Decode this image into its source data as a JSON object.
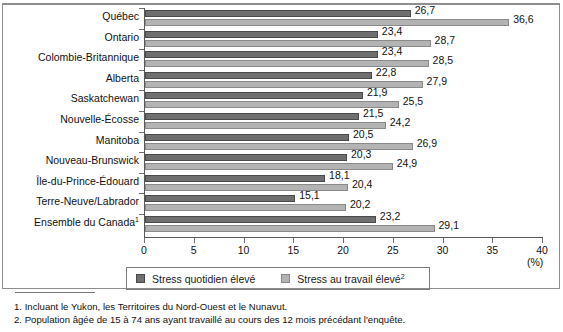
{
  "chart_data": {
    "type": "bar",
    "orientation": "horizontal",
    "title": "",
    "xlabel": "(%)",
    "ylabel": "",
    "xlim": [
      0,
      40
    ],
    "xticks": [
      0,
      5,
      10,
      15,
      20,
      25,
      30,
      35,
      40
    ],
    "grid": false,
    "legend_position": "bottom",
    "categories": [
      "Québec",
      "Ontario",
      "Colombie-Britannique",
      "Alberta",
      "Saskatchewan",
      "Nouvelle-Écosse",
      "Manitoba",
      "Nouveau-Brunswick",
      "Île-du-Prince-Édouard",
      "Terre-Neuve/Labrador",
      "Ensemble du Canada"
    ],
    "category_footnote_markers": [
      "",
      "",
      "",
      "",
      "",
      "",
      "",
      "",
      "",
      "",
      "1"
    ],
    "series": [
      {
        "name": "Stress quotidien élevé",
        "color": "#6f6f6f",
        "values": [
          26.7,
          23.4,
          23.4,
          22.8,
          21.9,
          21.5,
          20.5,
          20.3,
          18.1,
          15.1,
          23.2
        ],
        "labels": [
          "26,7",
          "23,4",
          "23,4",
          "22,8",
          "21,9",
          "21,5",
          "20,5",
          "20,3",
          "18,1",
          "15,1",
          "23,2"
        ]
      },
      {
        "name": "Stress au travail élevé",
        "color": "#b3b3b3",
        "values": [
          36.6,
          28.7,
          28.5,
          27.9,
          25.5,
          24.2,
          26.9,
          24.9,
          20.4,
          20.2,
          29.1
        ],
        "labels": [
          "36,6",
          "28,7",
          "28,5",
          "27,9",
          "25,5",
          "24,2",
          "26,9",
          "24,9",
          "20,4",
          "20,2",
          "29,1"
        ]
      }
    ]
  },
  "axis": {
    "x_tick_labels": [
      "0",
      "5",
      "10",
      "15",
      "20",
      "25",
      "30",
      "35",
      "40"
    ],
    "unit_label": "(%)"
  },
  "legend": {
    "items": [
      {
        "label": "Stress quotidien élevé",
        "marker": "",
        "swatch": "dark"
      },
      {
        "label": "Stress au travail élevé",
        "marker": "2",
        "swatch": "light"
      }
    ]
  },
  "footnotes": [
    "1. Incluant le Yukon, les Territoires du Nord-Ouest et le Nunavut.",
    "2. Population âgée de 15 à 74 ans ayant travaillé au cours des 12 mois précédant l'enquête."
  ],
  "colors": {
    "series_dark": "#6f6f6f",
    "series_light": "#b3b3b3",
    "axis": "#5a5a5a",
    "text": "#111111"
  }
}
